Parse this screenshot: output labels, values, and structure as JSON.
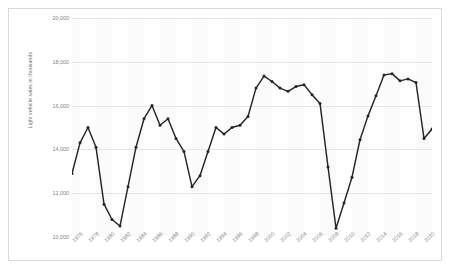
{
  "chart_data": {
    "type": "line",
    "title": "",
    "xlabel": "",
    "ylabel": "Light vehicle sales in thousands",
    "ylim": [
      10000,
      20000
    ],
    "xlim": [
      1976,
      2021
    ],
    "y_ticks": [
      "20,000",
      "18,000",
      "16,000",
      "14,000",
      "12,000",
      "10,000"
    ],
    "y_tick_values": [
      20000,
      18000,
      16000,
      14000,
      12000,
      10000
    ],
    "x_tick_labels": [
      "1976",
      "1978",
      "1980",
      "1982",
      "1984",
      "1986",
      "1988",
      "1990",
      "1992",
      "1994",
      "1996",
      "1998",
      "2000",
      "2002",
      "2004",
      "2006",
      "2008",
      "2010",
      "2012",
      "2014",
      "2016",
      "2018",
      "2020"
    ],
    "x_tick_values": [
      1976,
      1978,
      1980,
      1982,
      1984,
      1986,
      1988,
      1990,
      1992,
      1994,
      1996,
      1998,
      2000,
      2002,
      2004,
      2006,
      2008,
      2010,
      2012,
      2014,
      2016,
      2018,
      2020
    ],
    "grid": "horizontal",
    "legend": "none",
    "line_color": "#262626",
    "marker": "circle",
    "series": [
      {
        "name": "Light vehicle sales",
        "x": [
          1976,
          1977,
          1978,
          1979,
          1980,
          1981,
          1982,
          1983,
          1984,
          1985,
          1986,
          1987,
          1988,
          1989,
          1990,
          1991,
          1992,
          1993,
          1994,
          1995,
          1996,
          1997,
          1998,
          1999,
          2000,
          2001,
          2002,
          2003,
          2004,
          2005,
          2006,
          2007,
          2008,
          2009,
          2010,
          2011,
          2012,
          2013,
          2014,
          2015,
          2016,
          2017,
          2018,
          2019,
          2020,
          2021
        ],
        "values": [
          12900,
          14300,
          15000,
          14100,
          11500,
          10800,
          10500,
          12300,
          14100,
          15400,
          16000,
          15100,
          15400,
          14500,
          13900,
          12300,
          12800,
          13900,
          15000,
          14700,
          15000,
          15100,
          15500,
          16800,
          17350,
          17100,
          16800,
          16650,
          16870,
          16950,
          16500,
          16100,
          13200,
          10400,
          11550,
          12730,
          14440,
          15530,
          16450,
          17400,
          17460,
          17130,
          17220,
          17050,
          14500,
          14930
        ]
      }
    ]
  }
}
